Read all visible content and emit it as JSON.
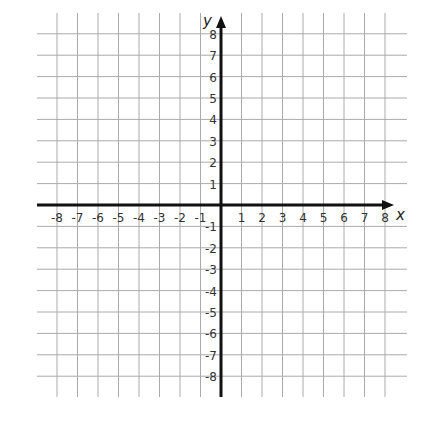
{
  "diagram": {
    "type": "coordinate-plane",
    "x_axis": {
      "label": "x",
      "min": -8,
      "max": 8,
      "ticks": [
        -8,
        -7,
        -6,
        -5,
        -4,
        -3,
        -2,
        -1,
        1,
        2,
        3,
        4,
        5,
        6,
        7,
        8
      ]
    },
    "y_axis": {
      "label": "y",
      "min": -8,
      "max": 8,
      "ticks": [
        8,
        7,
        6,
        5,
        4,
        3,
        2,
        1,
        -1,
        -2,
        -3,
        -4,
        -5,
        -6,
        -7,
        -8
      ]
    },
    "grid": true,
    "colors": {
      "grid": "#aaaaaa",
      "axis": "#111111",
      "text": "#333333",
      "background": "#ffffff"
    }
  },
  "chart_data": {
    "type": "scatter",
    "title": "",
    "xlabel": "x",
    "ylabel": "y",
    "xlim": [
      -8,
      8
    ],
    "ylim": [
      -8,
      8
    ],
    "x_tick_labels": [
      "-8",
      "-7",
      "-6",
      "-5",
      "-4",
      "-3",
      "-2",
      "-1",
      "1",
      "2",
      "3",
      "4",
      "5",
      "6",
      "7",
      "8"
    ],
    "y_tick_labels": [
      "8",
      "7",
      "6",
      "5",
      "4",
      "3",
      "2",
      "1",
      "-1",
      "-2",
      "-3",
      "-4",
      "-5",
      "-6",
      "-7",
      "-8"
    ],
    "grid": true,
    "series": []
  }
}
